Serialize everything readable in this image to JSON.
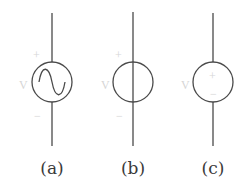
{
  "diagram": {
    "type": "circuit-symbols",
    "stroke_color": "#4a4a4a",
    "faint_label_color": "#d6d6d6",
    "symbols": [
      {
        "id": "a",
        "caption": "(a)",
        "kind": "ac-voltage-source",
        "glyph": "sine-wave",
        "plus_label": "+",
        "minus_label": "−",
        "voltage_label": "V",
        "cx": 52,
        "cy": 82,
        "r": 20
      },
      {
        "id": "b",
        "caption": "(b)",
        "kind": "independent-source",
        "glyph": "vertical-line-through",
        "plus_label": "+",
        "minus_label": "−",
        "voltage_label": "V",
        "cx": 133,
        "cy": 82,
        "r": 20
      },
      {
        "id": "c",
        "caption": "(c)",
        "kind": "dc-voltage-source",
        "glyph": "plus-minus",
        "plus_label": "+",
        "minus_label": "−",
        "voltage_label": "V",
        "cx": 213,
        "cy": 82,
        "r": 20
      }
    ]
  }
}
